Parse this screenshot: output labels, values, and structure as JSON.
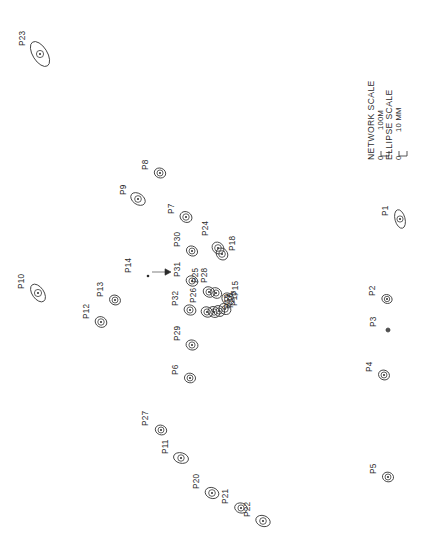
{
  "figure": {
    "background_color": "#ffffff",
    "ink_color": "#3a3a3a",
    "width": 422,
    "height": 550,
    "label_rotation_deg": -90
  },
  "legend": {
    "network_scale_label": "NETWORK SCALE",
    "network_scale_zero": "0",
    "network_scale_max": "100M",
    "ellipse_scale_label": "ELLIPSE SCALE",
    "ellipse_scale_zero": "0",
    "ellipse_scale_max": "10 MM"
  },
  "annotation": {
    "pointer_target": "P14",
    "pointer_glyph": "arrow-right"
  },
  "chart_data": {
    "type": "scatter",
    "xlabel": "",
    "ylabel": "",
    "grid": false,
    "legend_position": "top-right",
    "units": {
      "network": "M",
      "ellipse": "MM"
    },
    "scales": {
      "network_scale_bar_meters": 100,
      "ellipse_scale_bar_mm": 10
    },
    "point_count": 32,
    "points": [
      {
        "name": "P1",
        "x": 400,
        "y": 219,
        "rx": 9.5,
        "ry": 5.0,
        "tilt": 75,
        "label_dx": -12,
        "label_dy": -3
      },
      {
        "name": "P2",
        "x": 387,
        "y": 299,
        "rx": 5.2,
        "ry": 4.4,
        "tilt": 20,
        "label_dx": -12,
        "label_dy": -3
      },
      {
        "name": "P3",
        "x": 388,
        "y": 330,
        "rx": 1.6,
        "ry": 1.4,
        "tilt": 0,
        "label_dx": -12,
        "label_dy": -3
      },
      {
        "name": "P4",
        "x": 384,
        "y": 375,
        "rx": 5.6,
        "ry": 4.8,
        "tilt": 25,
        "label_dx": -12,
        "label_dy": -3
      },
      {
        "name": "P5",
        "x": 388,
        "y": 477,
        "rx": 5.6,
        "ry": 4.8,
        "tilt": 15,
        "label_dx": -12,
        "label_dy": -3
      },
      {
        "name": "P6",
        "x": 190,
        "y": 378,
        "rx": 5.6,
        "ry": 4.8,
        "tilt": 10,
        "label_dx": -12,
        "label_dy": -3
      },
      {
        "name": "P7",
        "x": 186,
        "y": 217,
        "rx": 6.2,
        "ry": 5.2,
        "tilt": 30,
        "label_dx": -12,
        "label_dy": -3
      },
      {
        "name": "P8",
        "x": 160,
        "y": 173,
        "rx": 5.8,
        "ry": 4.9,
        "tilt": 20,
        "label_dx": -12,
        "label_dy": -3
      },
      {
        "name": "P9",
        "x": 138,
        "y": 199,
        "rx": 8.0,
        "ry": 5.4,
        "tilt": 35,
        "label_dx": -12,
        "label_dy": -4
      },
      {
        "name": "P10",
        "x": 38,
        "y": 293,
        "rx": 10.0,
        "ry": 5.8,
        "tilt": 55,
        "label_dx": -14,
        "label_dy": -4
      },
      {
        "name": "P11",
        "x": 181,
        "y": 458,
        "rx": 7.6,
        "ry": 5.2,
        "tilt": 15,
        "label_dx": -13,
        "label_dy": -4
      },
      {
        "name": "P12",
        "x": 101,
        "y": 322,
        "rx": 6.0,
        "ry": 5.2,
        "tilt": 30,
        "label_dx": -12,
        "label_dy": -3
      },
      {
        "name": "P13",
        "x": 115,
        "y": 300,
        "rx": 5.6,
        "ry": 4.8,
        "tilt": 25,
        "label_dx": -12,
        "label_dy": -3
      },
      {
        "name": "P14",
        "x": 148,
        "y": 276,
        "rx": 0,
        "ry": 0,
        "tilt": 0,
        "label_dx": -17,
        "label_dy": -3
      },
      {
        "name": "P15",
        "x": 228,
        "y": 299,
        "rx": 6.6,
        "ry": 5.6,
        "tilt": 45,
        "label_dx": 10,
        "label_dy": -3
      },
      {
        "name": "P16",
        "x": 219,
        "y": 311,
        "rx": 6.0,
        "ry": 5.0,
        "tilt": 40,
        "label_dx": 14,
        "label_dy": -3
      },
      {
        "name": "P17",
        "x": 225,
        "y": 309,
        "rx": 6.2,
        "ry": 5.2,
        "tilt": 35,
        "label_dx": 12,
        "label_dy": -3
      },
      {
        "name": "P18",
        "x": 222,
        "y": 254,
        "rx": 6.4,
        "ry": 5.4,
        "tilt": 50,
        "label_dx": 13,
        "label_dy": -3
      },
      {
        "name": "P19",
        "x": 214,
        "y": 312,
        "rx": 6.2,
        "ry": 5.2,
        "tilt": 30,
        "label_dx": 16,
        "label_dy": -3
      },
      {
        "name": "P20",
        "x": 212,
        "y": 493,
        "rx": 7.0,
        "ry": 5.4,
        "tilt": 20,
        "label_dx": -13,
        "label_dy": -4
      },
      {
        "name": "P21",
        "x": 241,
        "y": 508,
        "rx": 6.4,
        "ry": 5.0,
        "tilt": 15,
        "label_dx": -13,
        "label_dy": -4
      },
      {
        "name": "P22",
        "x": 263,
        "y": 521,
        "rx": 7.4,
        "ry": 5.4,
        "tilt": 20,
        "label_dx": -13,
        "label_dy": -4
      },
      {
        "name": "P23",
        "x": 40,
        "y": 54,
        "rx": 14.0,
        "ry": 7.2,
        "tilt": 58,
        "label_dx": -15,
        "label_dy": -8
      },
      {
        "name": "P24",
        "x": 218,
        "y": 248,
        "rx": 6.4,
        "ry": 5.4,
        "tilt": 45,
        "label_dx": -10,
        "label_dy": -12
      },
      {
        "name": "P25",
        "x": 209,
        "y": 292,
        "rx": 6.0,
        "ry": 5.0,
        "tilt": 30,
        "label_dx": -11,
        "label_dy": -9
      },
      {
        "name": "P26",
        "x": 207,
        "y": 312,
        "rx": 6.0,
        "ry": 5.0,
        "tilt": 25,
        "label_dx": -11,
        "label_dy": -9
      },
      {
        "name": "P27",
        "x": 161,
        "y": 430,
        "rx": 5.8,
        "ry": 4.8,
        "tilt": 20,
        "label_dx": -13,
        "label_dy": -4
      },
      {
        "name": "P28",
        "x": 216,
        "y": 293,
        "rx": 6.0,
        "ry": 5.0,
        "tilt": 35,
        "label_dx": -9,
        "label_dy": -10
      },
      {
        "name": "P29",
        "x": 192,
        "y": 345,
        "rx": 6.0,
        "ry": 5.0,
        "tilt": 15,
        "label_dx": -12,
        "label_dy": -4
      },
      {
        "name": "P30",
        "x": 192,
        "y": 251,
        "rx": 5.8,
        "ry": 4.8,
        "tilt": 30,
        "label_dx": -12,
        "label_dy": -4
      },
      {
        "name": "P31",
        "x": 192,
        "y": 281,
        "rx": 6.0,
        "ry": 5.0,
        "tilt": 25,
        "label_dx": -12,
        "label_dy": -4
      },
      {
        "name": "P32",
        "x": 190,
        "y": 310,
        "rx": 6.0,
        "ry": 5.0,
        "tilt": 20,
        "label_dx": -12,
        "label_dy": -4
      }
    ]
  }
}
